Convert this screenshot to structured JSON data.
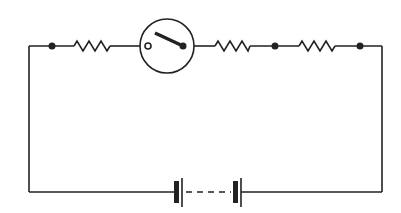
{
  "diagram": {
    "type": "electrical-circuit",
    "colors": {
      "line": "#222222",
      "background": "#ffffff"
    },
    "components": [
      {
        "id": "junction-1",
        "kind": "junction-dot"
      },
      {
        "id": "resistor-1",
        "kind": "resistor"
      },
      {
        "id": "switch",
        "kind": "switch",
        "state": "open"
      },
      {
        "id": "resistor-2",
        "kind": "resistor"
      },
      {
        "id": "junction-2",
        "kind": "junction-dot"
      },
      {
        "id": "resistor-3",
        "kind": "resistor"
      },
      {
        "id": "junction-3",
        "kind": "junction-dot"
      },
      {
        "id": "battery",
        "kind": "battery",
        "cells": "multiple (dashed between)"
      }
    ]
  }
}
